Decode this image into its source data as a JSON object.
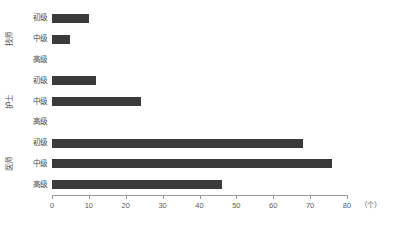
{
  "chart_data": {
    "type": "bar",
    "orientation": "horizontal",
    "title": "",
    "subtitle": "",
    "xlabel": "",
    "ylabel": "",
    "unit_label": "（个）",
    "xlim": [
      0,
      80
    ],
    "xticks": [
      0,
      10,
      20,
      30,
      40,
      50,
      60,
      70,
      80
    ],
    "xtick_labels": [
      "0",
      "10",
      "20",
      "30",
      "40",
      "50",
      "60",
      "70",
      "80"
    ],
    "grid": false,
    "legend": false,
    "bar_color": "#3b3b3b",
    "axis_color": "#9a9a9a",
    "groups": [
      {
        "name": "技师",
        "categories": [
          "初级",
          "中级",
          "高级"
        ],
        "values": [
          10,
          5,
          0
        ]
      },
      {
        "name": "护士",
        "categories": [
          "初级",
          "中级",
          "高级"
        ],
        "values": [
          12,
          24,
          0
        ]
      },
      {
        "name": "医师",
        "categories": [
          "初级",
          "中级",
          "高级"
        ],
        "values": [
          68,
          76,
          46
        ]
      }
    ],
    "bars": [
      {
        "group": "技师",
        "category": "初级",
        "value": 10
      },
      {
        "group": "技师",
        "category": "中级",
        "value": 5
      },
      {
        "group": "技师",
        "category": "高级",
        "value": 0
      },
      {
        "group": "护士",
        "category": "初级",
        "value": 12
      },
      {
        "group": "护士",
        "category": "中级",
        "value": 24
      },
      {
        "group": "护士",
        "category": "高级",
        "value": 0
      },
      {
        "group": "医师",
        "category": "初级",
        "value": 68
      },
      {
        "group": "医师",
        "category": "中级",
        "value": 76
      },
      {
        "group": "医师",
        "category": "高级",
        "value": 46
      }
    ]
  }
}
